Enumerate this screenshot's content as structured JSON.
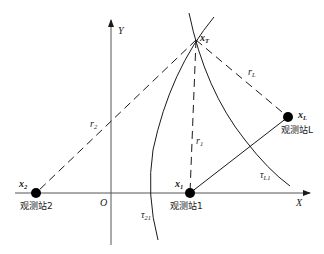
{
  "diagram": {
    "axes": {
      "x_label": "X",
      "y_label": "Y",
      "origin_label": "O"
    },
    "target": {
      "label": "x",
      "subscript": "T"
    },
    "stations": [
      {
        "label": "x",
        "subscript": "2",
        "name": "观测站2"
      },
      {
        "label": "x",
        "subscript": "1",
        "name": "观测站1"
      },
      {
        "label": "x",
        "subscript": "L",
        "name": "观测站L"
      }
    ],
    "ranges": [
      {
        "label": "r",
        "subscript": "2"
      },
      {
        "label": "r",
        "subscript": "1"
      },
      {
        "label": "r",
        "subscript": "L"
      }
    ],
    "curves": [
      {
        "label": "τ",
        "subscript": "21"
      },
      {
        "label": "τ",
        "subscript": "L1"
      }
    ],
    "colors": {
      "line": "#1a1a1a",
      "station_fill": "#000000"
    }
  }
}
